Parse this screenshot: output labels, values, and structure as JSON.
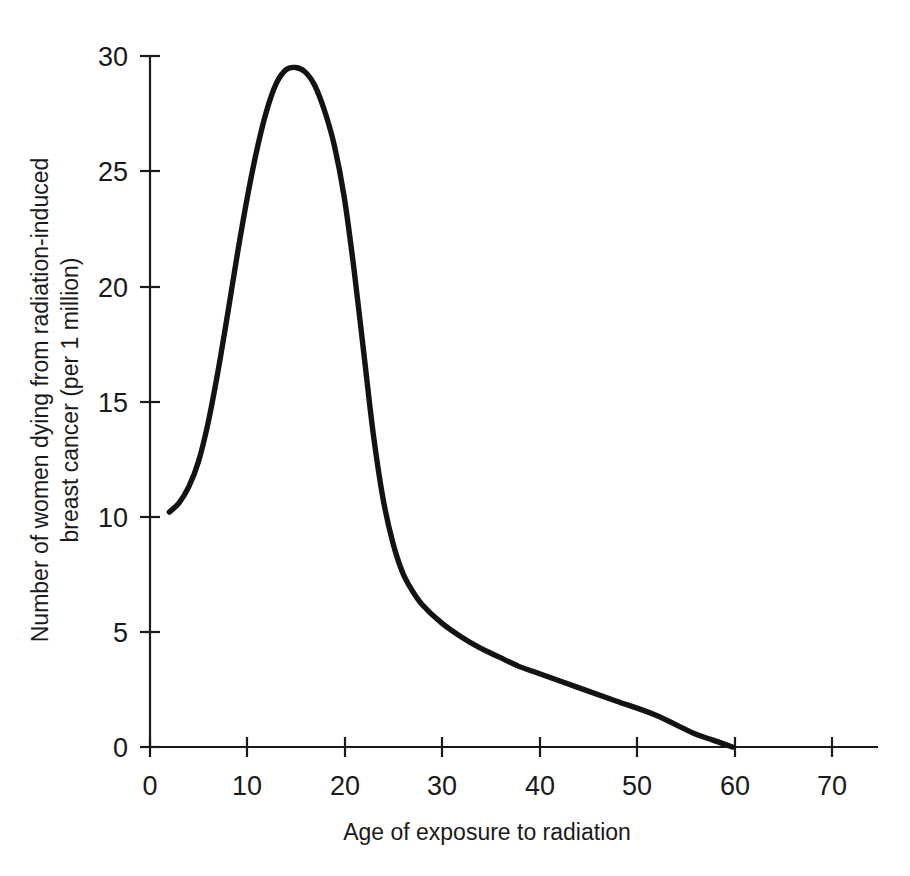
{
  "figure": {
    "background_color": "#ffffff",
    "ink_color": "#131313"
  },
  "chart_data": {
    "type": "line",
    "title": "",
    "subtitle": "",
    "xlabel": "Age of exposure to radiation",
    "ylabel": "Number of women dying from radiation-induced breast cancer (per 1 million)",
    "ylabel_line1": "Number of women dying from radiation-induced",
    "ylabel_line2": "breast cancer (per 1 million)",
    "xlim": [
      0,
      75
    ],
    "ylim": [
      0,
      30
    ],
    "xticks": [
      0,
      10,
      20,
      30,
      40,
      50,
      60,
      70
    ],
    "yticks": [
      0,
      5,
      10,
      15,
      20,
      25,
      30
    ],
    "xtick_labels": [
      "0",
      "10",
      "20",
      "30",
      "40",
      "50",
      "60",
      "70"
    ],
    "ytick_labels": [
      "0",
      "5",
      "10",
      "15",
      "20",
      "25",
      "30"
    ],
    "grid": false,
    "legend": false,
    "legend_position": "none",
    "series": [
      {
        "name": "Radiation-induced breast cancer deaths",
        "x": [
          2,
          3,
          4,
          5,
          6,
          7,
          8,
          9,
          10,
          11,
          12,
          13,
          14,
          15,
          16,
          17,
          18,
          19,
          20,
          21,
          22,
          23,
          24,
          25,
          26,
          27,
          28,
          30,
          32,
          34,
          36,
          38,
          40,
          44,
          48,
          52,
          56,
          58,
          60
        ],
        "y": [
          10.2,
          10.6,
          11.3,
          12.4,
          14.1,
          16.3,
          18.8,
          21.4,
          23.8,
          25.9,
          27.6,
          28.8,
          29.4,
          29.5,
          29.3,
          28.7,
          27.6,
          26.1,
          23.9,
          20.8,
          17.2,
          13.6,
          10.8,
          8.9,
          7.6,
          6.8,
          6.2,
          5.4,
          4.8,
          4.3,
          3.9,
          3.5,
          3.2,
          2.6,
          2.0,
          1.4,
          0.6,
          0.3,
          0.0
        ]
      }
    ],
    "annotations": []
  },
  "axes": {
    "x_axis_name": "x-axis",
    "y_axis_name": "y-axis"
  }
}
